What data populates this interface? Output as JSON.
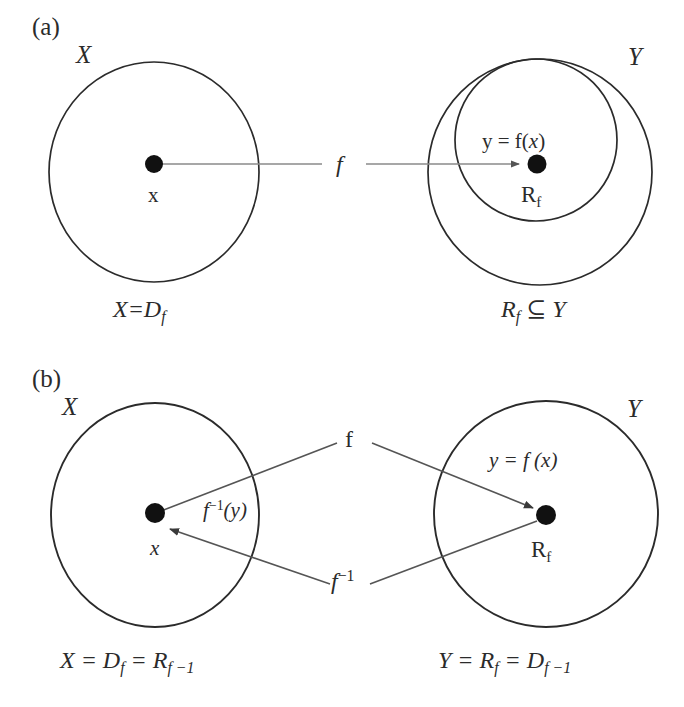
{
  "figure": {
    "background_color": "#ffffff",
    "stroke_color": "#2b2b2b",
    "dot_color": "#111111",
    "width": 684,
    "height": 707
  },
  "panel_a": {
    "tag": "(a)",
    "domain_circle": {
      "set_label": "X",
      "point_label": "x",
      "caption_prefix": "X=D",
      "caption_sub": "f"
    },
    "codomain_circle": {
      "set_label": "Y",
      "range_label_prefix": "R",
      "range_label_sub": "f",
      "equation_lead": "y = f(",
      "equation_var": "x",
      "equation_tail": ")",
      "caption_prefix": "R",
      "caption_sub": "f",
      "caption_tail": " ⊆ Y"
    },
    "map_label": "f"
  },
  "panel_b": {
    "tag": "(b)",
    "domain_circle": {
      "set_label": "X",
      "point_label": "x",
      "caption_lead": "X = D",
      "caption_sub1": "f",
      "caption_mid": " = R",
      "caption_sub2": "f −1"
    },
    "codomain_circle": {
      "set_label": "Y",
      "range_label_prefix": "R",
      "range_label_sub": "f",
      "equation_lead": "y = f (",
      "equation_var": "x",
      "equation_tail": ")",
      "caption_lead": "Y = R",
      "caption_sub1": "f",
      "caption_mid": " = D",
      "caption_sub2": "f −1"
    },
    "forward_map_label": "f",
    "inverse_map_label": "f",
    "inverse_map_exponent": "−1",
    "inverse_value_label": "f",
    "inverse_value_exponent": "−1",
    "inverse_value_arg": "(y)"
  }
}
